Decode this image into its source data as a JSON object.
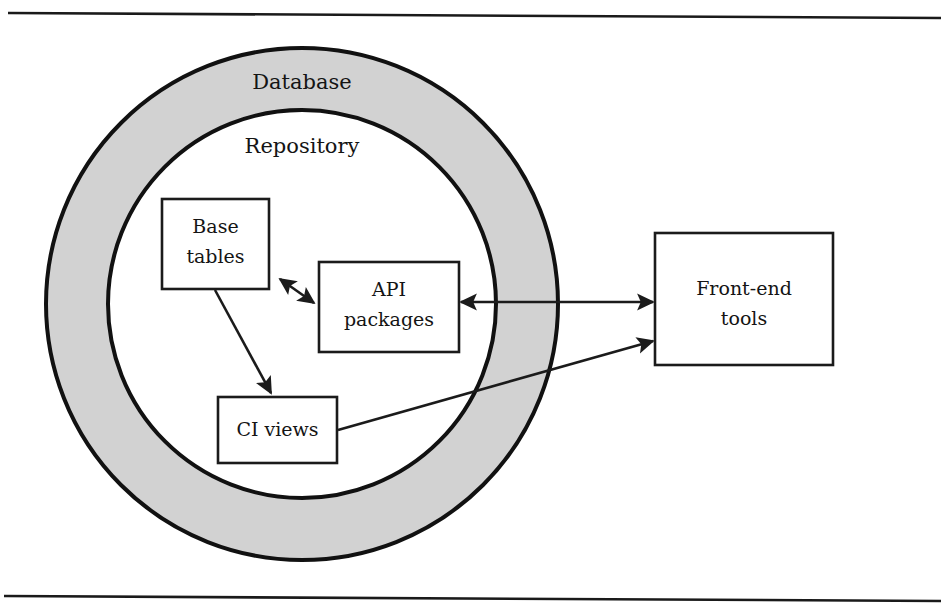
{
  "figure": {
    "background_color": "#ffffff",
    "line_color": "#1b1b1b",
    "ring_fill_color": "#d2d2d2",
    "box_fill_color": "#ffffff"
  },
  "zones": [
    {
      "id": "database",
      "label": "Database",
      "shape": "ring-annulus",
      "label_x": 302,
      "label_y": 83
    },
    {
      "id": "repository",
      "label": "Repository",
      "shape": "circle",
      "label_x": 302,
      "label_y": 147
    }
  ],
  "boxes": [
    {
      "id": "base-tables",
      "lines": [
        "Base",
        "tables"
      ],
      "x": 162,
      "y": 199,
      "w": 107,
      "h": 90,
      "inside_zone": "repository"
    },
    {
      "id": "api-packages",
      "lines": [
        "API",
        "packages"
      ],
      "x": 319,
      "y": 262,
      "w": 140,
      "h": 90,
      "inside_zone": "repository"
    },
    {
      "id": "ci-views",
      "lines": [
        "CI views"
      ],
      "x": 218,
      "y": 397,
      "w": 119,
      "h": 66,
      "inside_zone": "repository"
    },
    {
      "id": "front-end-tools",
      "lines": [
        "Front-end",
        "tools"
      ],
      "x": 655,
      "y": 233,
      "w": 178,
      "h": 132,
      "inside_zone": "outside"
    }
  ],
  "connectors": [
    {
      "id": "base-tables-to-api-packages",
      "from": "base-tables",
      "to": "api-packages",
      "arrowheads": "both",
      "style": "straight"
    },
    {
      "id": "base-tables-to-ci-views",
      "from": "base-tables",
      "to": "ci-views",
      "arrowheads": "end",
      "style": "straight"
    },
    {
      "id": "api-packages-to-front-end-tools",
      "from": "api-packages",
      "to": "front-end-tools",
      "arrowheads": "both",
      "style": "straight"
    },
    {
      "id": "ci-views-to-front-end-tools",
      "from": "ci-views",
      "to": "front-end-tools",
      "arrowheads": "end",
      "style": "straight"
    }
  ],
  "rules": [
    {
      "id": "top-rule",
      "x1": 8,
      "y1": 13,
      "x2": 941,
      "y2": 18
    },
    {
      "id": "bottom-rule",
      "x1": 4,
      "y1": 596,
      "x2": 941,
      "y2": 601
    }
  ]
}
